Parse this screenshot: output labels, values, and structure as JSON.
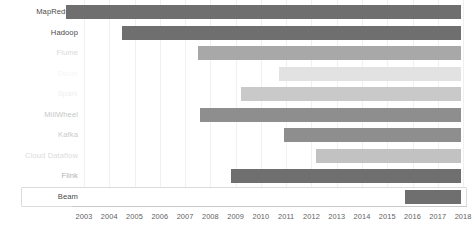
{
  "chart_data": {
    "type": "bar",
    "chart_subtype": "gantt-timeline",
    "title": "",
    "xlabel": "",
    "ylabel": "",
    "xlim": [
      2002.2,
      2018.6
    ],
    "grid": true,
    "legend": false,
    "x_tick_labels": [
      "2003",
      "2004",
      "2005",
      "2006",
      "2007",
      "2008",
      "2009",
      "2010",
      "2011",
      "2012",
      "2013",
      "2014",
      "2015",
      "2016",
      "2017",
      "2018"
    ],
    "categories": [
      "MapReduce",
      "Hadoop",
      "Flume",
      "Storm",
      "Spark",
      "MillWheel",
      "Kafka",
      "Cloud Dataflow",
      "Flink",
      "Beam"
    ],
    "bars": [
      {
        "label": "MapReduce",
        "start": 2002.3,
        "end": 2017.9,
        "color": "#6f6f6f",
        "label_opacity": 1.0,
        "highlighted": false
      },
      {
        "label": "Hadoop",
        "start": 2004.5,
        "end": 2017.9,
        "color": "#6f6f6f",
        "label_opacity": 1.0,
        "highlighted": false
      },
      {
        "label": "Flume",
        "start": 2007.5,
        "end": 2017.9,
        "color": "#a8a8a8",
        "label_opacity": 0.22,
        "highlighted": false
      },
      {
        "label": "Storm",
        "start": 2010.7,
        "end": 2017.9,
        "color": "#e2e2e2",
        "label_opacity": 0.05,
        "highlighted": false
      },
      {
        "label": "Spark",
        "start": 2009.2,
        "end": 2017.9,
        "color": "#c9c9c9",
        "label_opacity": 0.09,
        "highlighted": false
      },
      {
        "label": "MillWheel",
        "start": 2007.6,
        "end": 2017.9,
        "color": "#8e8e8e",
        "label_opacity": 0.33,
        "highlighted": false
      },
      {
        "label": "Kafka",
        "start": 2010.9,
        "end": 2017.9,
        "color": "#8e8e8e",
        "label_opacity": 0.3,
        "highlighted": false
      },
      {
        "label": "Cloud Dataflow",
        "start": 2012.2,
        "end": 2017.9,
        "color": "#c2c2c2",
        "label_opacity": 0.2,
        "highlighted": false
      },
      {
        "label": "Flink",
        "start": 2008.8,
        "end": 2017.9,
        "color": "#6f6f6f",
        "label_opacity": 0.45,
        "highlighted": false
      },
      {
        "label": "Beam",
        "start": 2015.7,
        "end": 2017.9,
        "color": "#6f6f6f",
        "label_opacity": 1.0,
        "highlighted": true
      }
    ],
    "colors": {
      "bar_dark": "#6f6f6f",
      "bar_mid": "#8e8e8e",
      "bar_light": "#c9c9c9",
      "bar_lightest": "#e2e2e2",
      "gridline": "#f0f0f0",
      "axis_line": "#c9c9c9",
      "tick_text": "#5f5f5f",
      "label_text": "#4a4a4a",
      "highlight_border": "#dcdcdc"
    }
  }
}
